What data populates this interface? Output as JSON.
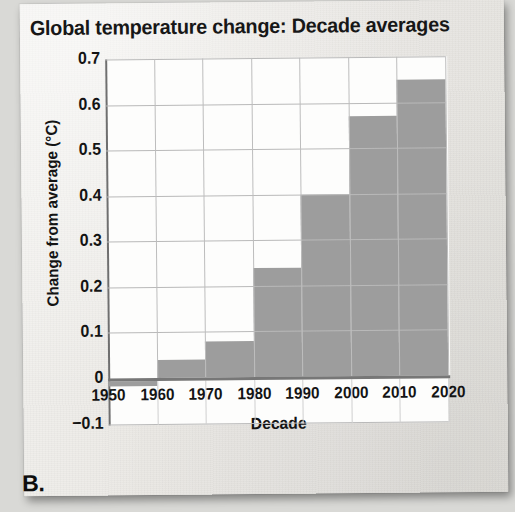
{
  "figure": {
    "label": "B.",
    "title": "Global temperature change: Decade averages"
  },
  "chart_data": {
    "type": "bar",
    "title": "Global temperature change: Decade averages",
    "xlabel": "Decade",
    "ylabel": "Change from average (°C)",
    "categories": [
      "1950",
      "1960",
      "1970",
      "1980",
      "1990",
      "2000",
      "2010"
    ],
    "values": [
      -0.01,
      0.04,
      0.08,
      0.24,
      0.4,
      0.57,
      0.65
    ],
    "x_tick_labels": [
      "1950",
      "1960",
      "1970",
      "1980",
      "1990",
      "2000",
      "2010",
      "2020"
    ],
    "y_tick_labels": [
      "0.7",
      "0.6",
      "0.5",
      "0.4",
      "0.3",
      "0.2",
      "0.1",
      "0",
      "−0.1"
    ],
    "y_tick_values": [
      0.7,
      0.6,
      0.5,
      0.4,
      0.3,
      0.2,
      0.1,
      0,
      -0.1
    ],
    "xlim": [
      1950,
      2020
    ],
    "ylim": [
      -0.1,
      0.7
    ],
    "grid": true,
    "legend": "none",
    "bar_color": "#9d9d9d",
    "plot_background": "#fdfdfc",
    "page_background": "#eceae6",
    "axis_color": "#6f6f6f",
    "grid_color": "#b9b9b9",
    "text_color": "#141414"
  }
}
